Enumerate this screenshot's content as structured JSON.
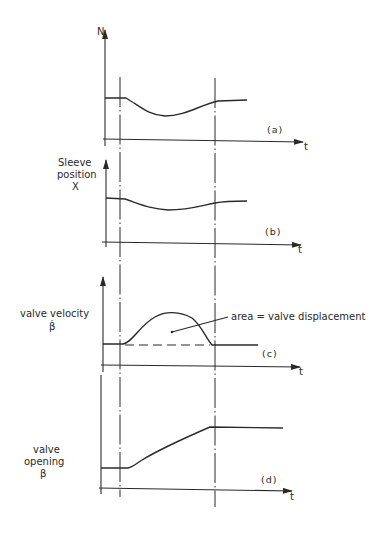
{
  "figure": {
    "panels": [
      {
        "id": "a",
        "tag": "(a)",
        "y_label_lines": [
          "N"
        ],
        "x_label": "t",
        "description": "Speed N: flat, dips between events, recovers"
      },
      {
        "id": "b",
        "tag": "(b)",
        "y_label_lines": [
          "Sleeve",
          "position",
          "X"
        ],
        "x_label": "t",
        "description": "Sleeve position: flat, dips slightly, recovers"
      },
      {
        "id": "c",
        "tag": "(c)",
        "y_label_lines": [
          "valve velocity",
          "β̇"
        ],
        "x_label": "t",
        "annotation": "area = valve displacement",
        "description": "Valve velocity: zero, single hump between events, back to zero"
      },
      {
        "id": "d",
        "tag": "(d)",
        "y_label_lines": [
          "valve",
          "opening",
          "β"
        ],
        "x_label": "t",
        "description": "Valve opening: flat, ramps up between events, flat at higher level"
      }
    ],
    "event_markers": [
      "t1",
      "t2"
    ],
    "colors": {
      "ink": "#2a2a2a",
      "paper": "#ffffff"
    }
  }
}
